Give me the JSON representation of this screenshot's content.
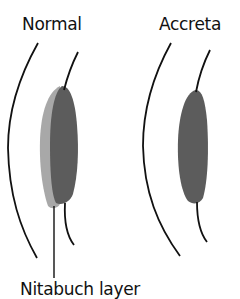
{
  "diagram": {
    "panels": [
      {
        "label": "Normal",
        "layers": [
          "outer-wall",
          "decidua-light",
          "placenta-dark",
          "inner-wall"
        ]
      },
      {
        "label": "Accreta",
        "layers": [
          "outer-wall",
          "placenta-dark",
          "inner-wall"
        ]
      }
    ],
    "pointer_label": "Nitabuch layer",
    "colors": {
      "line": "#111111",
      "dark_fill": "#5c5c5c",
      "light_fill": "#a8a8a8",
      "background": "#ffffff"
    }
  }
}
